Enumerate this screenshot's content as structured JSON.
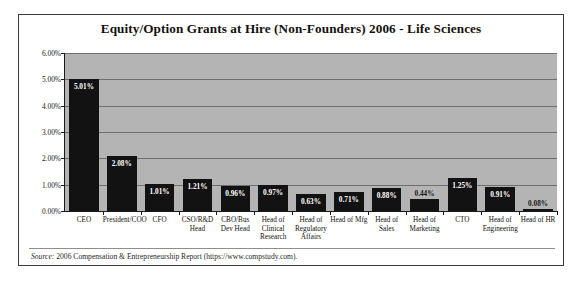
{
  "chart_data": {
    "type": "bar",
    "title": "Equity/Option Grants at Hire (Non-Founders) 2006 - Life Sciences",
    "xlabel": "",
    "ylabel": "",
    "ylim": [
      0,
      6
    ],
    "ytick_labels": [
      "0.00%",
      "1.00%",
      "2.00%",
      "3.00%",
      "4.00%",
      "5.00%",
      "6.00%"
    ],
    "ytick_values": [
      0,
      1,
      2,
      3,
      4,
      5,
      6
    ],
    "grid": true,
    "legend": false,
    "categories": [
      "CEO",
      "President/COO",
      "CFO",
      "CSO/R&D Head",
      "CBO/Bus Dev Head",
      "Head of Clinical Research",
      "Head of Regulatory Affairs",
      "Head of Mfg",
      "Head of Sales",
      "Head of Marketing",
      "CTO",
      "Head of Engineering",
      "Head of HR"
    ],
    "values": [
      5.01,
      2.08,
      1.01,
      1.21,
      0.96,
      0.97,
      0.63,
      0.71,
      0.88,
      0.44,
      1.25,
      0.91,
      0.08
    ],
    "data_labels": [
      "5.01%",
      "2.08%",
      "1.01%",
      "1.21%",
      "0.96%",
      "0.97%",
      "0.63%",
      "0.71%",
      "0.88%",
      "0.44%",
      "1.25%",
      "0.91%",
      "0.08%"
    ],
    "bar_color": "#121212",
    "plot_background": "#b4b4b4",
    "source_prefix": "Source:",
    "source_text": " 2006 Compensation & Entrepreneurship Report (https://www.compstudy.com)."
  }
}
